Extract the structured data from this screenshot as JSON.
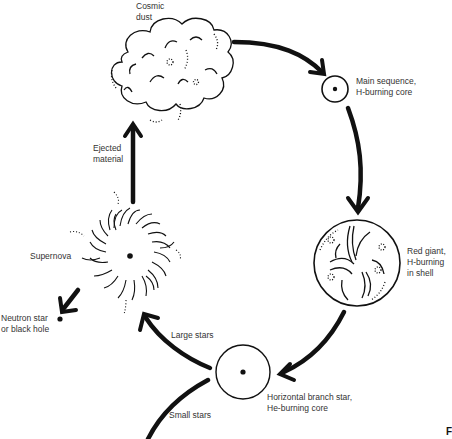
{
  "diagram": {
    "nodes": [
      {
        "id": "cosmic-dust",
        "label": "Cosmic\ndust"
      },
      {
        "id": "main-sequence",
        "label": "Main sequence,\nH-burning core"
      },
      {
        "id": "red-giant",
        "label": "Red giant,\nH-burning\nin shell"
      },
      {
        "id": "horizontal-branch",
        "label": "Horizontal branch star,\nHe-burning core"
      },
      {
        "id": "supernova",
        "label": "Supernova"
      },
      {
        "id": "neutron-star",
        "label": "Neutron star\nor black hole"
      }
    ],
    "edges": [
      {
        "from": "cosmic-dust",
        "to": "main-sequence",
        "label": ""
      },
      {
        "from": "main-sequence",
        "to": "red-giant",
        "label": ""
      },
      {
        "from": "red-giant",
        "to": "horizontal-branch",
        "label": ""
      },
      {
        "from": "horizontal-branch",
        "to": "supernova",
        "label": "Large stars"
      },
      {
        "from": "horizontal-branch",
        "to": "off-page",
        "label": "Small stars"
      },
      {
        "from": "supernova",
        "to": "neutron-star",
        "label": ""
      },
      {
        "from": "supernova",
        "to": "cosmic-dust",
        "label": "Ejected\nmaterial"
      }
    ],
    "corner_text": "F"
  }
}
